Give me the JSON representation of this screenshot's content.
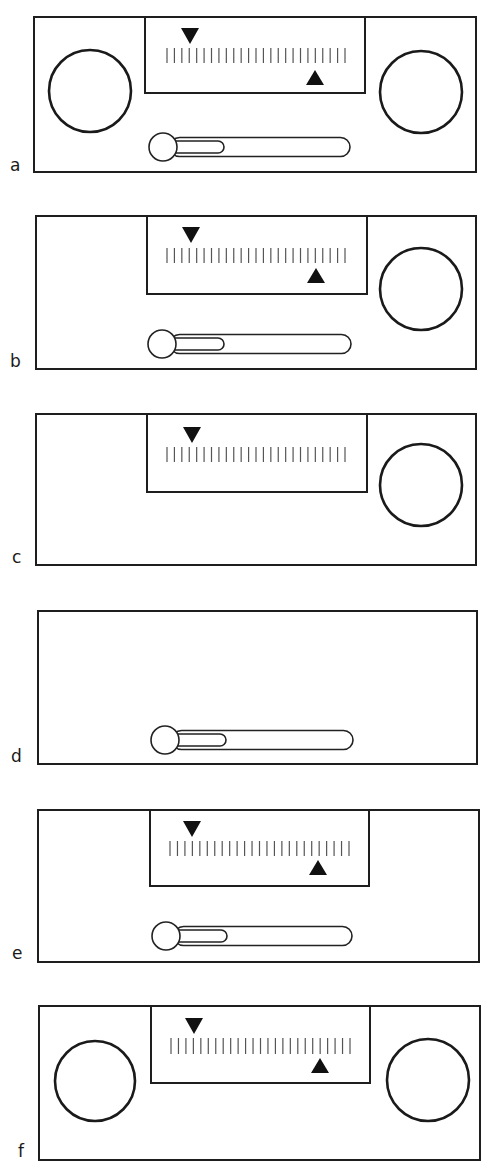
{
  "figure": {
    "width": 491,
    "height": 1176,
    "colors": {
      "line": "#1e1e1e",
      "marker": "#111111",
      "tick": "#555555",
      "background": "#ffffff"
    },
    "tick_count": 25
  },
  "panels": [
    {
      "label": "a",
      "frame": {
        "x": 34,
        "y": 17,
        "w": 442,
        "h": 155
      },
      "scale": {
        "x": 145,
        "y": 17,
        "w": 220,
        "h": 76,
        "tick_x0": 167,
        "tick_x1": 345,
        "tick_y": 48,
        "tick_h": 15
      },
      "down_marker": {
        "present": true,
        "x": 190,
        "y": 28
      },
      "up_marker": {
        "present": true,
        "x": 315,
        "y": 70
      },
      "left_dial": {
        "present": true,
        "cx": 90,
        "cy": 91,
        "r": 41
      },
      "right_dial": {
        "present": true,
        "cx": 421,
        "cy": 92,
        "r": 41
      },
      "slider": {
        "present": true,
        "knob_cx": 163,
        "knob_cy": 147,
        "knob_r": 14,
        "track_x": 170,
        "track_w": 180,
        "track_h": 19,
        "fill_w": 54
      },
      "label_pos": {
        "x": 10,
        "y": 157
      }
    },
    {
      "label": "b",
      "frame": {
        "x": 36,
        "y": 216,
        "w": 440,
        "h": 153
      },
      "scale": {
        "x": 147,
        "y": 216,
        "w": 220,
        "h": 78,
        "tick_x0": 167,
        "tick_x1": 345,
        "tick_y": 248,
        "tick_h": 15
      },
      "down_marker": {
        "present": true,
        "x": 191,
        "y": 227
      },
      "up_marker": {
        "present": true,
        "x": 316,
        "y": 268
      },
      "left_dial": {
        "present": false
      },
      "right_dial": {
        "present": true,
        "cx": 421,
        "cy": 289,
        "r": 41
      },
      "slider": {
        "present": true,
        "knob_cx": 162,
        "knob_cy": 344,
        "knob_r": 14,
        "track_x": 170,
        "track_w": 181,
        "track_h": 19,
        "fill_w": 54
      },
      "label_pos": {
        "x": 10,
        "y": 353
      }
    },
    {
      "label": "c",
      "frame": {
        "x": 36,
        "y": 414,
        "w": 440,
        "h": 151
      },
      "scale": {
        "x": 147,
        "y": 414,
        "w": 220,
        "h": 78,
        "tick_x0": 167,
        "tick_x1": 345,
        "tick_y": 447,
        "tick_h": 15
      },
      "down_marker": {
        "present": true,
        "x": 192,
        "y": 427
      },
      "up_marker": {
        "present": false
      },
      "left_dial": {
        "present": false
      },
      "right_dial": {
        "present": true,
        "cx": 421,
        "cy": 485,
        "r": 41
      },
      "slider": {
        "present": false
      },
      "label_pos": {
        "x": 12,
        "y": 549
      }
    },
    {
      "label": "d",
      "frame": {
        "x": 38,
        "y": 611,
        "w": 439,
        "h": 153
      },
      "scale": {
        "present": false
      },
      "down_marker": {
        "present": false
      },
      "up_marker": {
        "present": false
      },
      "left_dial": {
        "present": false
      },
      "right_dial": {
        "present": false
      },
      "slider": {
        "present": true,
        "knob_cx": 165,
        "knob_cy": 740,
        "knob_r": 14,
        "track_x": 172,
        "track_w": 181,
        "track_h": 19,
        "fill_w": 54
      },
      "label_pos": {
        "x": 11,
        "y": 748
      }
    },
    {
      "label": "e",
      "frame": {
        "x": 38,
        "y": 810,
        "w": 441,
        "h": 152
      },
      "scale": {
        "x": 150,
        "y": 810,
        "w": 219,
        "h": 76,
        "tick_x0": 170,
        "tick_x1": 349,
        "tick_y": 841,
        "tick_h": 15
      },
      "down_marker": {
        "present": true,
        "x": 192,
        "y": 821
      },
      "up_marker": {
        "present": true,
        "x": 318,
        "y": 860
      },
      "left_dial": {
        "present": false
      },
      "right_dial": {
        "present": false
      },
      "slider": {
        "present": true,
        "knob_cx": 166,
        "knob_cy": 936,
        "knob_r": 14,
        "track_x": 174,
        "track_w": 178,
        "track_h": 19,
        "fill_w": 53
      },
      "label_pos": {
        "x": 12,
        "y": 945
      }
    },
    {
      "label": "f",
      "frame": {
        "x": 39,
        "y": 1006,
        "w": 441,
        "h": 154
      },
      "scale": {
        "x": 151,
        "y": 1006,
        "w": 219,
        "h": 77,
        "tick_x0": 171,
        "tick_x1": 350,
        "tick_y": 1038,
        "tick_h": 16
      },
      "down_marker": {
        "present": true,
        "x": 194,
        "y": 1018
      },
      "up_marker": {
        "present": true,
        "x": 320,
        "y": 1058
      },
      "left_dial": {
        "present": true,
        "cx": 95,
        "cy": 1081,
        "r": 40
      },
      "right_dial": {
        "present": true,
        "cx": 428,
        "cy": 1080,
        "r": 41
      },
      "slider": {
        "present": false
      },
      "label_pos": {
        "x": 18,
        "y": 1143
      }
    }
  ]
}
